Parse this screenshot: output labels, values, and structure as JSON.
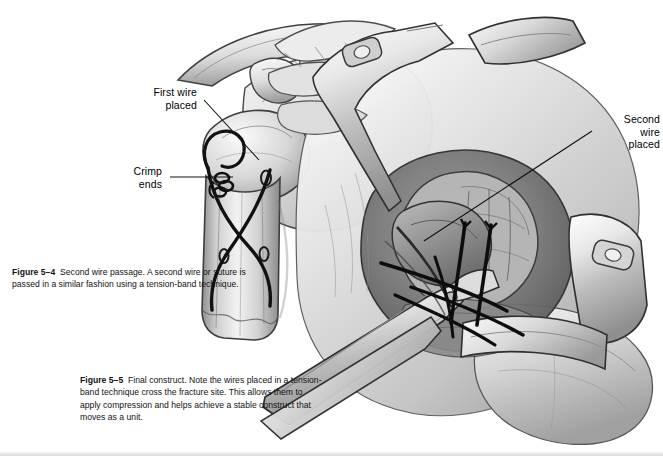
{
  "page": {
    "background_color": "#ffffff",
    "ink_color": "#000000",
    "style": "grayscale pencil and wash medical illustration"
  },
  "annotations": [
    {
      "id": "first-wire-placed",
      "text": "First wire\nplaced",
      "align": "right"
    },
    {
      "id": "crimp-ends",
      "text": "Crimp\nends",
      "align": "right"
    },
    {
      "id": "second-wire-placed",
      "text": "Second\nwire\nplaced",
      "align": "right"
    }
  ],
  "figures": [
    {
      "id": "figure-5-4",
      "label": "Figure 5–4",
      "caption": "Second wire passage. A second wire or suture is passed in a similar fashion using a tension-band technique.",
      "subject": "anterior humerus and scapula with first wire crimped and second wire passed"
    },
    {
      "id": "figure-5-5",
      "label": "Figure 5–5",
      "caption": "Final construct. Note the wires placed in a tension-band technique cross the fracture site. This allows them to apply compression and helps achieve a stable construct that moves as a unit.",
      "subject": "open surgical field with retractors, forceps and crossed tension-band wires"
    }
  ]
}
